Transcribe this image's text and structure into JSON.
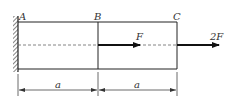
{
  "diagram": {
    "points": [
      {
        "id": "A",
        "label": "A"
      },
      {
        "id": "B",
        "label": "B"
      },
      {
        "id": "C",
        "label": "C"
      }
    ],
    "loads": [
      {
        "at": "B",
        "label": "F",
        "direction": "right"
      },
      {
        "at": "C",
        "label": "2F",
        "direction": "right"
      }
    ],
    "dimensions": [
      {
        "from": "A",
        "to": "B",
        "label": "a"
      },
      {
        "from": "B",
        "to": "C",
        "label": "a"
      }
    ],
    "support": "fixed-wall-left",
    "colors": {
      "line": "#222222",
      "dash": "#555555",
      "dim": "#444444"
    }
  }
}
